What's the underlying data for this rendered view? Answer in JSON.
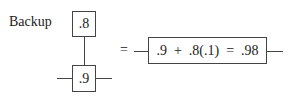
{
  "diagram": {
    "label": "Backup",
    "backup_box": ".8",
    "primary_box": ".9",
    "equals": "=",
    "result_box": ".9  +  .8(.1)  =  .98"
  }
}
